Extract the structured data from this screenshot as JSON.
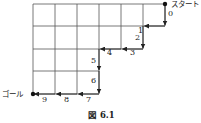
{
  "diagram": {
    "start_label": "スタート",
    "goal_label": "ゴール",
    "caption": "図 6.1",
    "grid": {
      "columns": 6,
      "rows": 4
    },
    "path_steps": [
      {
        "step": "0",
        "direction": "down"
      },
      {
        "step": "1",
        "direction": "left"
      },
      {
        "step": "2",
        "direction": "down"
      },
      {
        "step": "3",
        "direction": "left"
      },
      {
        "step": "4",
        "direction": "left"
      },
      {
        "step": "5",
        "direction": "down"
      },
      {
        "step": "6",
        "direction": "down"
      },
      {
        "step": "7",
        "direction": "left"
      },
      {
        "step": "8",
        "direction": "left"
      },
      {
        "step": "9",
        "direction": "left"
      }
    ]
  }
}
